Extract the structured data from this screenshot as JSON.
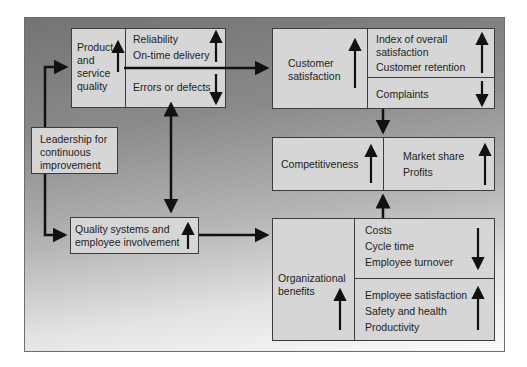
{
  "diagram": {
    "leadership": {
      "lines": [
        "Leadership for",
        "continuous",
        "improvement"
      ]
    },
    "product_quality": {
      "label_lines": [
        "Product",
        "and",
        "service",
        "quality"
      ],
      "label_trend": "up",
      "upper": {
        "items": [
          "Reliability",
          "On-time delivery"
        ],
        "trend": "up"
      },
      "lower": {
        "items": [
          "Errors or defects"
        ],
        "trend": "down"
      }
    },
    "quality_systems": {
      "lines": [
        "Quality systems and",
        "employee involvement"
      ],
      "trend": "up"
    },
    "customer_satisfaction": {
      "label_lines": [
        "Customer",
        "satisfaction"
      ],
      "label_trend": "up",
      "upper": {
        "items": [
          "Index of overall",
          "satisfaction",
          "Customer retention"
        ],
        "trend": "up"
      },
      "lower": {
        "items": [
          "Complaints"
        ],
        "trend": "down"
      }
    },
    "competitiveness": {
      "label": "Competitiveness",
      "label_trend": "up",
      "right": {
        "items": [
          "Market share",
          "Profits"
        ],
        "trend": "up"
      }
    },
    "organizational_benefits": {
      "label_lines": [
        "Organizational",
        "benefits"
      ],
      "label_trend": "up",
      "upper": {
        "items": [
          "Costs",
          "Cycle time",
          "Employee turnover"
        ],
        "trend": "down"
      },
      "lower": {
        "items": [
          "Employee satisfaction",
          "Safety and health",
          "Productivity"
        ],
        "trend": "up"
      }
    }
  },
  "colors": {
    "box_fill": "#d6d6d6",
    "border": "#3c3c3c",
    "arrow": "#111111"
  }
}
